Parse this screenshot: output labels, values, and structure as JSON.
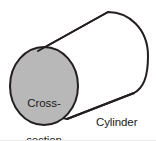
{
  "figure": {
    "background_color": "#ffffff",
    "stroke_color": "#231f20",
    "circle_fill_color": "#b8b8b8",
    "text_color": "#1a1a1a",
    "width": 156,
    "height": 141
  },
  "labels": {
    "cross_section_line1": "Cross-",
    "cross_section_line2": "section",
    "shape_name": "Cylinder"
  },
  "shapes": {
    "cross_section_circle": {
      "name": "cross-section-circle",
      "center_x": 44,
      "center_y": 86,
      "radius_x": 34,
      "radius_y": 39,
      "fill": "#b8b8b8",
      "stroke": "#231f20",
      "stroke_width": 2
    },
    "cylinder_body": {
      "name": "cylinder-body",
      "top_edge_start_x": 38,
      "top_edge_start_y": 51,
      "top_edge_end_x": 108,
      "top_edge_end_y": 12,
      "right_cap_extreme_x": 148,
      "right_cap_extreme_y": 56,
      "bottom_edge_start_x": 134,
      "bottom_edge_start_y": 93,
      "bottom_edge_end_x": 67,
      "bottom_edge_end_y": 119,
      "fill": "#ffffff",
      "stroke": "#231f20",
      "stroke_width": 2
    }
  }
}
